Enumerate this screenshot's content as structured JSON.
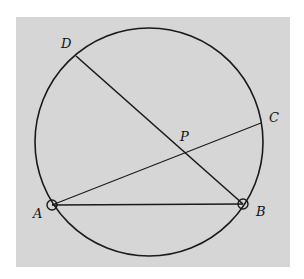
{
  "colors": {
    "background": "#ffffff",
    "panel": "#d6d6d6",
    "stroke": "#1a1a1a"
  },
  "circle": {
    "cx": 149,
    "cy": 142,
    "r": 114
  },
  "points": {
    "A": {
      "x": 52,
      "y": 205,
      "label": "A",
      "lx": 33,
      "ly": 218,
      "marked": true
    },
    "B": {
      "x": 243,
      "y": 204,
      "label": "B",
      "lx": 256,
      "ly": 216,
      "marked": true
    },
    "C": {
      "x": 261,
      "y": 123,
      "label": "C",
      "lx": 269,
      "ly": 122,
      "marked": false
    },
    "D": {
      "x": 76,
      "y": 56,
      "label": "D",
      "lx": 61,
      "ly": 48,
      "marked": false
    },
    "P": {
      "x": 185,
      "y": 150,
      "label": "P",
      "lx": 180,
      "ly": 141,
      "marked": false
    }
  },
  "segments": [
    {
      "name": "chord-AB",
      "from": "A",
      "to": "B"
    },
    {
      "name": "chord-AC",
      "from": "A",
      "to": "C"
    },
    {
      "name": "chord-DB",
      "from": "D",
      "to": "B"
    }
  ]
}
